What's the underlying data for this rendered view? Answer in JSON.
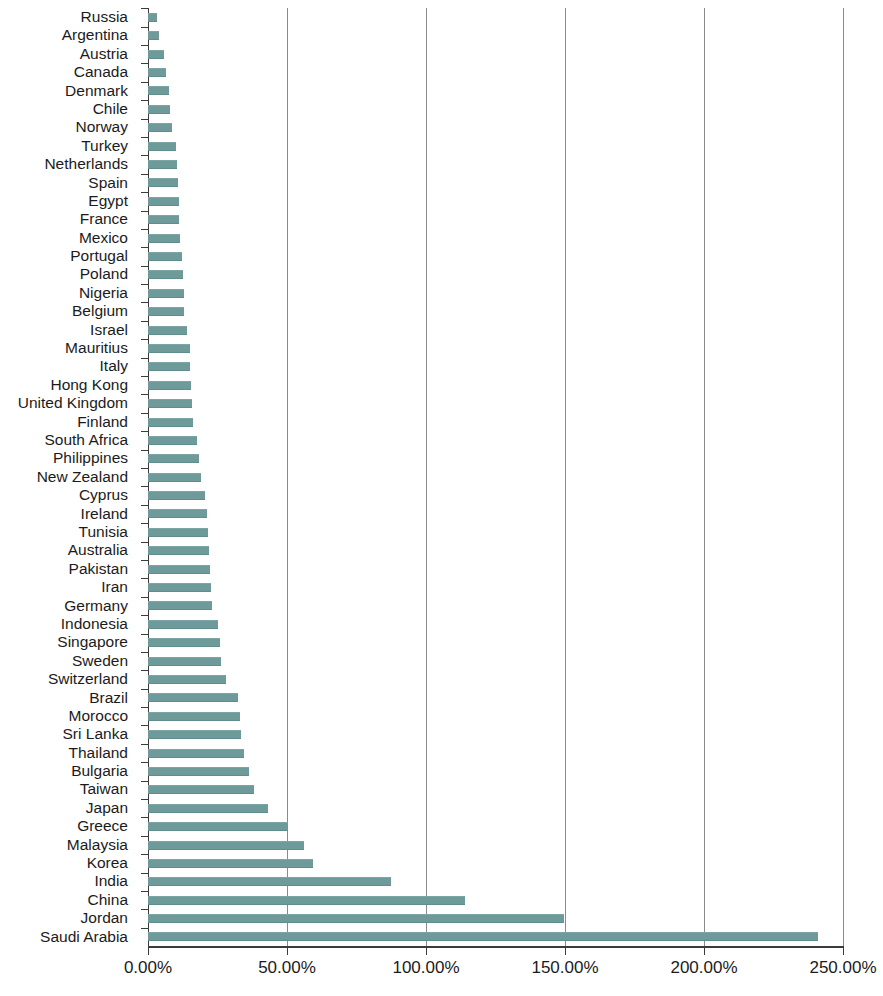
{
  "chart_data": {
    "type": "bar",
    "orientation": "horizontal",
    "title": "",
    "subtitle": "",
    "xlabel": "",
    "ylabel": "",
    "xlim": [
      0,
      250
    ],
    "xticks": [
      0,
      50,
      100,
      150,
      200,
      250
    ],
    "xtick_labels": [
      "0.00%",
      "50.00%",
      "100.00%",
      "150.00%",
      "200.00%",
      "250.00%"
    ],
    "tick_format": "percent",
    "grid": {
      "vertical": true,
      "horizontal": false
    },
    "legend": {
      "visible": false,
      "position": "none"
    },
    "bar_color": "#6f9a9a",
    "axis_color": "#3b3b3b",
    "gridline_color": "#8a8a8a",
    "categories": [
      "Russia",
      "Argentina",
      "Austria",
      "Canada",
      "Denmark",
      "Chile",
      "Norway",
      "Turkey",
      "Netherlands",
      "Spain",
      "Egypt",
      "France",
      "Mexico",
      "Portugal",
      "Poland",
      "Nigeria",
      "Belgium",
      "Israel",
      "Mauritius",
      "Italy",
      "Hong Kong",
      "United Kingdom",
      "Finland",
      "South Africa",
      "Philippines",
      "New Zealand",
      "Cyprus",
      "Ireland",
      "Tunisia",
      "Australia",
      "Pakistan",
      "Iran",
      "Germany",
      "Indonesia",
      "Singapore",
      "Sweden",
      "Switzerland",
      "Brazil",
      "Morocco",
      "Sri Lanka",
      "Thailand",
      "Bulgaria",
      "Taiwan",
      "Japan",
      "Greece",
      "Malaysia",
      "Korea",
      "India",
      "China",
      "Jordan",
      "Saudi Arabia"
    ],
    "values": [
      3.2,
      4.0,
      5.8,
      6.5,
      7.5,
      8.0,
      8.6,
      10.2,
      10.5,
      10.8,
      11.0,
      11.2,
      11.6,
      12.2,
      12.5,
      12.8,
      13.0,
      14.2,
      15.0,
      15.2,
      15.6,
      16.0,
      16.2,
      17.5,
      18.5,
      19.2,
      20.5,
      21.2,
      21.6,
      22.0,
      22.2,
      22.6,
      23.2,
      25.0,
      26.0,
      26.4,
      28.2,
      32.5,
      33.0,
      33.4,
      34.5,
      36.5,
      38.0,
      43.0,
      50.5,
      56.0,
      59.5,
      87.5,
      114.0,
      149.5,
      241.0
    ],
    "value_unit": "%"
  }
}
